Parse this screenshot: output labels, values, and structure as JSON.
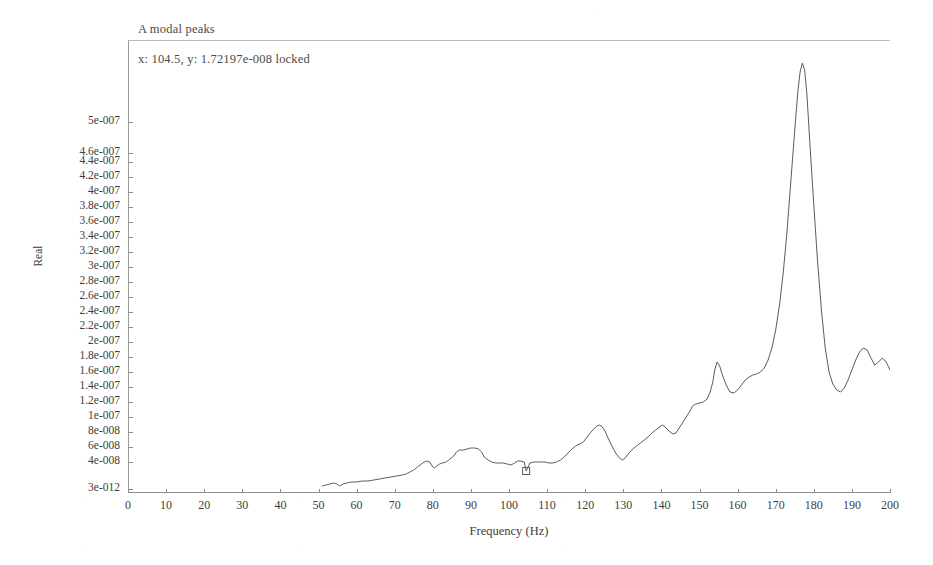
{
  "window": {
    "title": "A modal peaks"
  },
  "annotation": {
    "cursor_readout": "x: 104.5, y: 1.72197e-008 locked",
    "cursor_x": 104.5,
    "cursor_y_text": "1.72197e-008",
    "cursor_state": "locked"
  },
  "style": {
    "curve_color": "#5c5c5c",
    "axis_color": "#8f8f8f",
    "text_color": "#3d3d3d",
    "background": "#ffffff"
  },
  "chart_data": {
    "type": "line",
    "title": "A modal peaks",
    "xlabel": "Frequency (Hz)",
    "ylabel": "Real",
    "grid": false,
    "legend": "none",
    "xlim": [
      0,
      200
    ],
    "xticks": [
      0,
      10,
      20,
      30,
      40,
      50,
      60,
      70,
      80,
      90,
      100,
      110,
      120,
      130,
      140,
      150,
      160,
      170,
      180,
      190,
      200
    ],
    "xticklabels": [
      "0",
      "10",
      "20",
      "30",
      "40",
      "50",
      "60",
      "70",
      "80",
      "90",
      "100",
      "110",
      "120",
      "130",
      "140",
      "150",
      "160",
      "170",
      "180",
      "190",
      "200"
    ],
    "yticks": [
      3e-12,
      4e-08,
      6e-08,
      8e-08,
      1e-07,
      1.2e-07,
      1.4e-07,
      1.6e-07,
      1.8e-07,
      2e-07,
      2.2e-07,
      2.4e-07,
      2.6e-07,
      2.8e-07,
      3e-07,
      3.2e-07,
      3.4e-07,
      3.6e-07,
      3.8e-07,
      4e-07,
      4.2e-07,
      4.4e-07,
      4.6e-07,
      5e-07
    ],
    "yticklabels": [
      "3e-012",
      "4e-008",
      "6e-008",
      "8e-008",
      "1e-007",
      "1.2e-007",
      "1.4e-007",
      "1.6e-007",
      "1.8e-007",
      "2e-007",
      "2.2e-007",
      "2.4e-007",
      "2.6e-007",
      "2.8e-007",
      "3e-007",
      "3.2e-007",
      "3.4e-007",
      "3.6e-007",
      "3.8e-007",
      "4e-007",
      "4.2e-007",
      "4.4e-007",
      "4.6e-007",
      "5e-007"
    ],
    "ytick_pixel_y": [
      489,
      462,
      447,
      432,
      417,
      402,
      387,
      372,
      357,
      342,
      327,
      312,
      297,
      282,
      267,
      252,
      237,
      222,
      207,
      192,
      177,
      162,
      153,
      122
    ],
    "yscale": "custom-nonlinear",
    "series": [
      {
        "name": "Real",
        "marker": "none",
        "x": [
          51.0,
          52.0,
          53.0,
          54.0,
          54.8,
          55.5,
          56.5,
          57.5,
          58.5,
          60.0,
          61.5,
          63.0,
          64.5,
          66.0,
          67.5,
          69.0,
          70.5,
          72.0,
          73.0,
          74.0,
          75.0,
          76.0,
          77.0,
          77.8,
          78.5,
          79.2,
          79.8,
          80.4,
          81.0,
          81.8,
          82.5,
          83.5,
          84.5,
          85.5,
          86.2,
          87.0,
          88.0,
          89.0,
          90.0,
          91.0,
          92.0,
          92.8,
          93.5,
          94.5,
          95.5,
          96.5,
          97.5,
          98.5,
          99.5,
          100.5,
          101.5,
          102.2,
          103.0,
          104.0,
          104.5,
          105.5,
          106.5,
          107.5,
          108.5,
          109.5,
          110.5,
          111.5,
          112.5,
          113.5,
          114.5,
          115.5,
          116.5,
          117.5,
          118.5,
          119.5,
          120.5,
          121.5,
          122.5,
          123.0,
          123.8,
          124.5,
          125.2,
          126.0,
          127.0,
          128.0,
          129.0,
          129.8,
          130.5,
          131.5,
          132.5,
          133.5,
          134.5,
          135.5,
          136.5,
          137.5,
          138.5,
          139.5,
          140.3,
          141.0,
          142.0,
          143.0,
          143.8,
          144.5,
          145.5,
          146.5,
          147.5,
          148.2,
          149.0,
          150.0,
          151.0,
          152.0,
          152.8,
          153.5,
          154.0,
          154.6,
          155.3,
          156.0,
          157.0,
          158.0,
          159.0,
          160.0,
          161.0,
          162.0,
          163.0,
          164.0,
          165.0,
          166.0,
          167.0,
          168.0,
          169.0,
          170.0,
          171.0,
          172.0,
          173.0,
          174.0,
          175.0,
          175.8,
          176.4,
          177.0,
          177.6,
          178.2,
          179.0,
          180.0,
          181.0,
          182.0,
          183.0,
          184.0,
          185.0,
          186.0,
          187.0,
          188.0,
          189.0,
          190.0,
          191.0,
          192.0,
          193.0,
          194.0,
          195.0,
          196.0,
          197.0,
          198.0,
          199.0,
          200.0
        ],
        "y_pixel": [
          486,
          485,
          484,
          483,
          484,
          486,
          484,
          483,
          482,
          482,
          481,
          481,
          480,
          479,
          478,
          477,
          476,
          475,
          474,
          472,
          470,
          467,
          464,
          462,
          461,
          462,
          466,
          468,
          466,
          464,
          463,
          462,
          459,
          456,
          452,
          450,
          450,
          449,
          448,
          448,
          449,
          452,
          457,
          460,
          462,
          463,
          463,
          463,
          464,
          465,
          463,
          461,
          461,
          462,
          471,
          463,
          462,
          462,
          462,
          462,
          463,
          463,
          462,
          460,
          457,
          453,
          449,
          446,
          444,
          442,
          437,
          432,
          428,
          426,
          425,
          427,
          431,
          438,
          446,
          453,
          458,
          460,
          458,
          453,
          449,
          446,
          443,
          440,
          437,
          433,
          430,
          427,
          425,
          427,
          431,
          434,
          433,
          429,
          423,
          417,
          411,
          406,
          404,
          403,
          402,
          399,
          392,
          382,
          370,
          362,
          366,
          375,
          385,
          392,
          393,
          390,
          385,
          380,
          377,
          375,
          374,
          372,
          368,
          360,
          348,
          330,
          305,
          272,
          230,
          180,
          130,
          92,
          72,
          63,
          70,
          95,
          145,
          205,
          262,
          310,
          348,
          372,
          384,
          390,
          392,
          388,
          380,
          370,
          360,
          352,
          348,
          350,
          358,
          365,
          362,
          358,
          362,
          370
        ],
        "description": "Frequency response magnitude (Real part) with a dominant modal peak near 177 Hz and secondary peaks near 89, 124, 140, 148 and 154 Hz; data begins at ~51 Hz."
      }
    ],
    "annotations": [
      {
        "type": "cursor-marker",
        "x": 104.5,
        "label": "x: 104.5, y: 1.72197e-008 locked",
        "shape": "small-square"
      }
    ],
    "peaks": [
      {
        "frequency_hz": 177,
        "label": "dominant modal peak"
      },
      {
        "frequency_hz": 154,
        "label": "secondary peak"
      },
      {
        "frequency_hz": 148,
        "label": "secondary peak"
      },
      {
        "frequency_hz": 140,
        "label": "secondary peak"
      },
      {
        "frequency_hz": 124,
        "label": "secondary peak"
      },
      {
        "frequency_hz": 196,
        "label": "tail peak"
      },
      {
        "frequency_hz": 89,
        "label": "low broad peak"
      }
    ]
  }
}
